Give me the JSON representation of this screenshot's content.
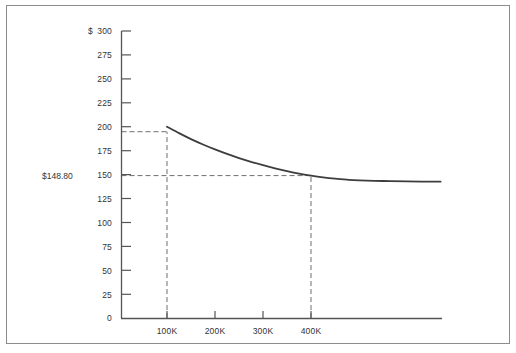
{
  "figure": {
    "background_color": "#ffffff",
    "border_color": "#8c8c8c",
    "axis_color": "#555555",
    "curve_color": "#3d3d3d",
    "dash_color": "#6e6e6e",
    "text_color": "#333333"
  },
  "chart_data": {
    "type": "line",
    "title": "",
    "subtitle": "",
    "xlabel": "",
    "ylabel": "",
    "currency_symbol": "$",
    "xlim": [
      0,
      670000
    ],
    "ylim": [
      0,
      300
    ],
    "grid": false,
    "legend": null,
    "y_ticks": [
      0,
      25,
      50,
      75,
      100,
      125,
      150,
      175,
      200,
      225,
      250,
      275,
      300
    ],
    "y_tick_labels": [
      "0",
      "25",
      "50",
      "75",
      "100",
      "125",
      "150",
      "175",
      "200",
      "225",
      "250",
      "275",
      "300"
    ],
    "y_axis_prefix_label": "$",
    "x_ticks": [
      100000,
      200000,
      300000,
      400000
    ],
    "x_tick_labels": [
      "100K",
      "200K",
      "300K",
      "400K"
    ],
    "series": [
      {
        "name": "cost-per-unit",
        "x": [
          100000,
          125000,
          150000,
          175000,
          200000,
          225000,
          250000,
          275000,
          300000,
          325000,
          350000,
          375000,
          400000,
          425000,
          450000,
          475000,
          500000,
          550000,
          600000,
          670000
        ],
        "values": [
          200.0,
          193.2,
          187.0,
          181.4,
          176.2,
          171.5,
          167.2,
          163.3,
          159.7,
          156.4,
          153.5,
          150.9,
          148.8,
          147.0,
          145.6,
          144.6,
          143.9,
          143.2,
          142.8,
          142.5
        ]
      }
    ],
    "annotations": [
      {
        "name": "value-callout",
        "label": "$148.80",
        "x": 400000,
        "y": 148.8,
        "guide_lines": [
          "horizontal-to-axis",
          "vertical-to-baseline"
        ]
      },
      {
        "name": "start-point-guide",
        "label": "",
        "x": 100000,
        "y": 200,
        "guide_lines": [
          "horizontal-to-axis",
          "vertical-to-baseline"
        ]
      }
    ]
  },
  "labels": {
    "value_callout": "$148.80",
    "y_axis_currency": "$",
    "y_300": "300",
    "y_275": "275",
    "y_250": "250",
    "y_225": "225",
    "y_200": "200",
    "y_175": "175",
    "y_150": "150",
    "y_125": "125",
    "y_100": "100",
    "y_75": "75",
    "y_50": "50",
    "y_25": "25",
    "y_0": "0",
    "x_100k": "100K",
    "x_200k": "200K",
    "x_300k": "300K",
    "x_400k": "400K"
  }
}
